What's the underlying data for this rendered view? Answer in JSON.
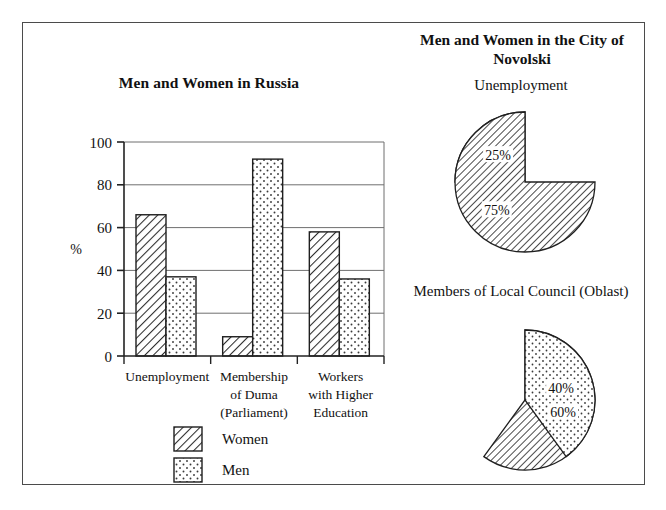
{
  "document": {
    "background_color": "#ffffff",
    "frame_color": "#4b4b4b"
  },
  "bar_panel": {
    "title": "Men and Women in Russia",
    "axis_label": "%",
    "legend": [
      {
        "label": "Women",
        "pattern": "diagonal-hatch"
      },
      {
        "label": "Men",
        "pattern": "dots"
      }
    ]
  },
  "pies_panel": {
    "title": "Men and Women in the City of Novolski",
    "captions": {
      "unemployment": "Unemployment",
      "council": "Members of Local Council (Oblast)"
    }
  },
  "chart_data": [
    {
      "type": "bar",
      "title": "Men and Women in Russia",
      "xlabel": "",
      "ylabel": "%",
      "ylim": [
        0,
        100
      ],
      "yticks": [
        0,
        20,
        40,
        60,
        80,
        100
      ],
      "ytick_labels": [
        "0",
        "20",
        "40",
        "60",
        "80",
        "100"
      ],
      "grid": true,
      "legend_position": "bottom-center",
      "categories": [
        "Unemployment",
        "Membership of Duma (Parliament)",
        "Workers with Higher Education"
      ],
      "category_lines": [
        [
          "Unemployment"
        ],
        [
          "Membership",
          "of Duma",
          "(Parliament)"
        ],
        [
          "Workers",
          "with Higher",
          "Education"
        ]
      ],
      "series": [
        {
          "name": "Women",
          "pattern": "diagonal-hatch",
          "values": [
            66,
            9,
            58
          ]
        },
        {
          "name": "Men",
          "pattern": "dots",
          "values": [
            37,
            92,
            36
          ]
        }
      ]
    },
    {
      "type": "pie",
      "title": "Unemployment",
      "group_title": "Men and Women in the City of Novolski",
      "labels": [
        "Men",
        "Women"
      ],
      "values": [
        25,
        75
      ],
      "value_labels": [
        "25%",
        "75%"
      ],
      "patterns": [
        "dots",
        "diagonal-hatch"
      ],
      "start_angle_deg": 270,
      "direction": "counterclockwise"
    },
    {
      "type": "pie",
      "title": "Members of Local Council (Oblast)",
      "group_title": "Men and Women in the City of Novolski",
      "labels": [
        "Women",
        "Men"
      ],
      "values": [
        60,
        40
      ],
      "value_labels": [
        "60%",
        "40%"
      ],
      "patterns": [
        "diagonal-hatch",
        "dots"
      ],
      "start_angle_deg": 270,
      "direction": "clockwise"
    }
  ]
}
